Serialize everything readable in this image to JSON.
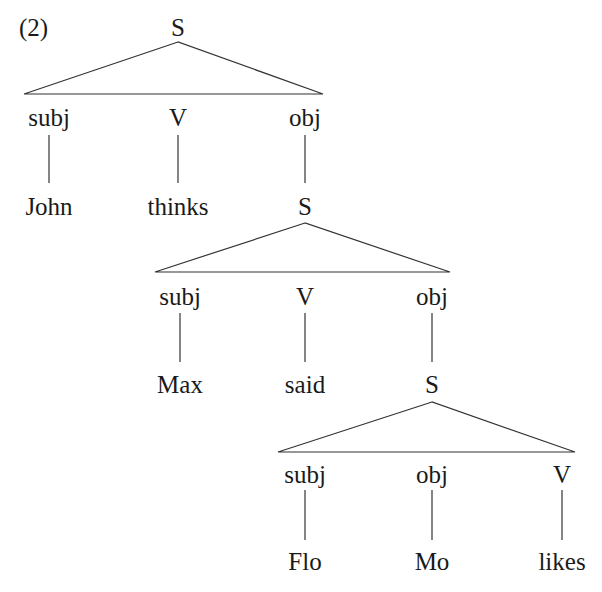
{
  "example_number": "(2)",
  "colors": {
    "ink": "#1a1a1a",
    "line": "#333333",
    "background": "#ffffff"
  },
  "tree": {
    "root": {
      "label": "S",
      "children": [
        {
          "relation": "subj",
          "leaf": "John"
        },
        {
          "relation": "V",
          "leaf": "thinks"
        },
        {
          "relation": "obj",
          "leaf": "S"
        }
      ]
    },
    "embedded_1": {
      "label": "S",
      "children": [
        {
          "relation": "subj",
          "leaf": "Max"
        },
        {
          "relation": "V",
          "leaf": "said"
        },
        {
          "relation": "obj",
          "leaf": "S"
        }
      ]
    },
    "embedded_2": {
      "label": "S",
      "children": [
        {
          "relation": "subj",
          "leaf": "Flo"
        },
        {
          "relation": "obj",
          "leaf": "Mo"
        },
        {
          "relation": "V",
          "leaf": "likes"
        }
      ]
    }
  }
}
